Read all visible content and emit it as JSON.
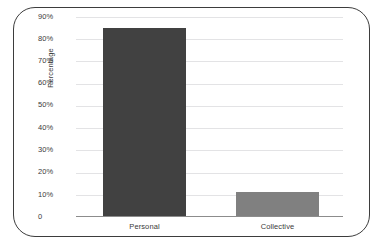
{
  "chart_data": {
    "type": "bar",
    "title": "",
    "xlabel": "",
    "ylabel": "Percentage",
    "categories": [
      "Personal",
      "Collective"
    ],
    "values": [
      85,
      11
    ],
    "value_labels": [
      "85%",
      "11%"
    ],
    "ylim": [
      0,
      90
    ],
    "ytick_labels": [
      "90%",
      "80%",
      "70%",
      "60%",
      "50%",
      "40%",
      "30%",
      "20%",
      "10%",
      "0"
    ],
    "ytick_values": [
      90,
      80,
      70,
      60,
      50,
      40,
      30,
      20,
      10,
      0
    ],
    "grid": true,
    "legend": "none",
    "bar_colors": [
      "#414141",
      "#808080"
    ],
    "series": [
      {
        "name": "Percentage",
        "values": [
          85,
          11
        ]
      }
    ]
  },
  "style": {
    "frame_color": "#3d3d3d",
    "gridline_color": "#e3e3e5",
    "axis_color": "#8c8c8c",
    "background": "#ffffff",
    "text_color": "#3a3a3a"
  }
}
